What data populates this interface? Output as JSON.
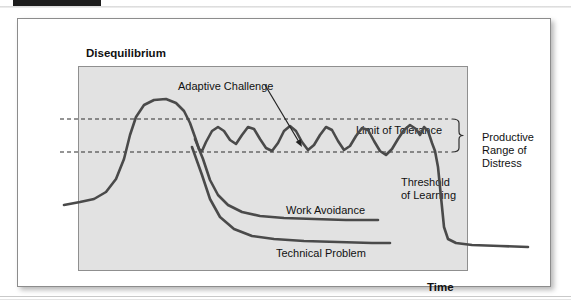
{
  "document": {
    "top_bar_color": "#1d1d1d"
  },
  "figure": {
    "panel_bg": "#e2e2e2",
    "curve_color": "#4a4a4a",
    "axes": {
      "y_title": "Disequilibrium",
      "x_title": "Time"
    },
    "annotations": {
      "adaptive_challenge": "Adaptive Challenge",
      "limit_of_tolerance": "Limit of Tolerance",
      "threshold_of_learning": "Threshold\nof Learning",
      "work_avoidance": "Work Avoidance",
      "technical_problem": "Technical Problem",
      "productive_range": "Productive\nRange of\nDistress"
    }
  },
  "chart_data": {
    "type": "line",
    "xlabel": "Time",
    "ylabel": "Disequilibrium",
    "xlim": [
      0,
      390
    ],
    "ylim": [
      0,
      205
    ],
    "grid": false,
    "legend": "inline-annotations",
    "reference_lines": [
      {
        "name": "Limit of Tolerance",
        "y": 72,
        "style": "dashed",
        "label": "Limit of Tolerance"
      },
      {
        "name": "Threshold of Learning",
        "y": 105,
        "style": "dashed",
        "label": "Threshold of Learning"
      }
    ],
    "band": {
      "name": "Productive Range of Distress",
      "y_top": 72,
      "y_bottom": 105,
      "label": "Productive Range of Distress"
    },
    "series": [
      {
        "name": "Adaptive Challenge",
        "label": "Adaptive Challenge",
        "points": [
          [
            4,
            158
          ],
          [
            20,
            155
          ],
          [
            34,
            152
          ],
          [
            46,
            145
          ],
          [
            56,
            132
          ],
          [
            64,
            112
          ],
          [
            70,
            88
          ],
          [
            76,
            70
          ],
          [
            84,
            58
          ],
          [
            94,
            53
          ],
          [
            106,
            52
          ],
          [
            116,
            56
          ],
          [
            124,
            64
          ],
          [
            130,
            76
          ],
          [
            135,
            90
          ],
          [
            139,
            102
          ],
          [
            142,
            104
          ],
          [
            146,
            95
          ],
          [
            152,
            84
          ],
          [
            158,
            80
          ],
          [
            164,
            84
          ],
          [
            170,
            93
          ],
          [
            176,
            97
          ],
          [
            182,
            88
          ],
          [
            188,
            80
          ],
          [
            194,
            82
          ],
          [
            200,
            92
          ],
          [
            206,
            101
          ],
          [
            212,
            104
          ],
          [
            218,
            96
          ],
          [
            224,
            84
          ],
          [
            230,
            79
          ],
          [
            236,
            84
          ],
          [
            242,
            95
          ],
          [
            248,
            103
          ],
          [
            254,
            98
          ],
          [
            260,
            88
          ],
          [
            266,
            80
          ],
          [
            272,
            83
          ],
          [
            278,
            94
          ],
          [
            284,
            103
          ],
          [
            290,
            99
          ],
          [
            296,
            89
          ],
          [
            302,
            81
          ],
          [
            308,
            83
          ],
          [
            314,
            94
          ],
          [
            320,
            104
          ],
          [
            326,
            108
          ],
          [
            332,
            102
          ],
          [
            338,
            92
          ],
          [
            344,
            83
          ],
          [
            350,
            78
          ],
          [
            356,
            82
          ],
          [
            360,
            88
          ],
          [
            364,
            80
          ],
          [
            368,
            84
          ],
          [
            372,
            96
          ],
          [
            375,
            104
          ],
          [
            378,
            120
          ],
          [
            381,
            150
          ],
          [
            384,
            180
          ],
          [
            388,
            192
          ],
          [
            396,
            196
          ],
          [
            412,
            198
          ],
          [
            440,
            199
          ],
          [
            468,
            200
          ]
        ]
      },
      {
        "name": "Work Avoidance",
        "label": "Work Avoidance",
        "points": [
          [
            135,
            92
          ],
          [
            143,
            112
          ],
          [
            150,
            133
          ],
          [
            158,
            148
          ],
          [
            168,
            158
          ],
          [
            182,
            165
          ],
          [
            200,
            169
          ],
          [
            224,
            171
          ],
          [
            254,
            172
          ],
          [
            286,
            173
          ],
          [
            318,
            173
          ]
        ]
      },
      {
        "name": "Technical Problem",
        "label": "Technical Problem",
        "points": [
          [
            132,
            100
          ],
          [
            142,
            128
          ],
          [
            150,
            152
          ],
          [
            160,
            170
          ],
          [
            174,
            182
          ],
          [
            192,
            189
          ],
          [
            214,
            192
          ],
          [
            244,
            194
          ],
          [
            278,
            195
          ],
          [
            312,
            196
          ],
          [
            330,
            196
          ]
        ]
      }
    ],
    "arrow_annotation": {
      "text": "Adaptive Challenge",
      "from": [
        205,
        38
      ],
      "to": [
        242,
        100
      ]
    }
  }
}
